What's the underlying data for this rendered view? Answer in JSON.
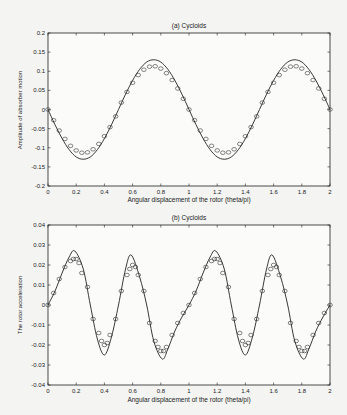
{
  "chart_data": [
    {
      "type": "line",
      "title": "(a) Cycloids",
      "xlabel": "Angular displacement of the rotor (theta/pi)",
      "ylabel": "Amplitude of absorber motion",
      "xlim": [
        0,
        2
      ],
      "ylim": [
        -0.2,
        0.2
      ],
      "xticks": [
        0,
        0.2,
        0.4,
        0.6,
        0.8,
        1,
        1.2,
        1.4,
        1.6,
        1.8,
        2
      ],
      "xticklabels": [
        "0",
        "0.2",
        "0.4",
        "0.6",
        "0.8",
        "1",
        "1.2",
        "1.4",
        "1.6",
        "1.8",
        "2"
      ],
      "yticks": [
        -0.2,
        -0.15,
        -0.1,
        -0.05,
        0,
        0.05,
        0.1,
        0.15,
        0.2
      ],
      "yticklabels": [
        "-0.2",
        "-0.15",
        "-0.1",
        "-0.05",
        "0",
        "0.05",
        "0.1",
        "0.15",
        "0.2"
      ],
      "grid": false,
      "series": [
        {
          "name": "solid line",
          "style": "line",
          "period": 1,
          "x": [
            0,
            0.05,
            0.1,
            0.15,
            0.2,
            0.25,
            0.3,
            0.35,
            0.4,
            0.45,
            0.5,
            0.55,
            0.6,
            0.65,
            0.7,
            0.75,
            0.8,
            0.85,
            0.9,
            0.95,
            1.0
          ],
          "values": [
            0,
            -0.04,
            -0.076,
            -0.105,
            -0.124,
            -0.13,
            -0.124,
            -0.105,
            -0.076,
            -0.04,
            0,
            0.04,
            0.076,
            0.105,
            0.124,
            0.13,
            0.124,
            0.105,
            0.076,
            0.04,
            0
          ]
        },
        {
          "name": "circle markers",
          "style": "markers",
          "period": 1,
          "x": [
            0,
            0.04,
            0.08,
            0.12,
            0.16,
            0.2,
            0.24,
            0.28,
            0.32,
            0.36,
            0.4,
            0.44,
            0.48,
            0.52,
            0.56,
            0.6,
            0.64,
            0.68,
            0.72,
            0.76,
            0.8,
            0.84,
            0.88,
            0.92,
            0.96,
            1.0
          ],
          "values": [
            0,
            -0.028,
            -0.055,
            -0.077,
            -0.095,
            -0.107,
            -0.113,
            -0.112,
            -0.104,
            -0.09,
            -0.07,
            -0.046,
            -0.018,
            0.018,
            0.046,
            0.07,
            0.09,
            0.104,
            0.112,
            0.113,
            0.107,
            0.095,
            0.077,
            0.055,
            0.028,
            0
          ]
        }
      ]
    },
    {
      "type": "line",
      "title": "(b) Cycloids",
      "xlabel": "Angular displacement of the rotor (theta/pi)",
      "ylabel": "The rotor acceleration",
      "xlim": [
        0,
        2
      ],
      "ylim": [
        -0.04,
        0.04
      ],
      "xticks": [
        0,
        0.2,
        0.4,
        0.6,
        0.8,
        1,
        1.2,
        1.4,
        1.6,
        1.8,
        2
      ],
      "xticklabels": [
        "0",
        "0.2",
        "0.4",
        "0.6",
        "0.8",
        "1",
        "1.2",
        "1.4",
        "1.6",
        "1.8",
        "2"
      ],
      "yticks": [
        -0.04,
        -0.03,
        -0.02,
        -0.01,
        0,
        0.01,
        0.02,
        0.03,
        0.04
      ],
      "yticklabels": [
        "-0.04",
        "-0.03",
        "-0.02",
        "-0.01",
        "0",
        "0.01",
        "0.02",
        "0.03",
        "0.04"
      ],
      "grid": false,
      "series": [
        {
          "name": "solid line",
          "style": "line",
          "period": 1,
          "x": [
            0,
            0.05,
            0.1,
            0.15,
            0.19,
            0.25,
            0.3,
            0.35,
            0.4,
            0.45,
            0.5,
            0.55,
            0.59,
            0.65,
            0.7,
            0.75,
            0.81,
            0.85,
            0.9,
            0.95,
            1.0
          ],
          "values": [
            0,
            0.007,
            0.016,
            0.024,
            0.027,
            0.018,
            0.0,
            -0.017,
            -0.025,
            -0.016,
            0.0,
            0.018,
            0.025,
            0.014,
            0.0,
            -0.018,
            -0.027,
            -0.022,
            -0.013,
            -0.006,
            0
          ]
        },
        {
          "name": "circle markers",
          "style": "markers",
          "period": 1,
          "x": [
            0,
            0.04,
            0.08,
            0.12,
            0.16,
            0.18,
            0.2,
            0.22,
            0.24,
            0.28,
            0.32,
            0.36,
            0.38,
            0.4,
            0.42,
            0.44,
            0.48,
            0.52,
            0.56,
            0.58,
            0.6,
            0.62,
            0.64,
            0.68,
            0.72,
            0.76,
            0.78,
            0.8,
            0.82,
            0.84,
            0.88,
            0.92,
            0.96,
            1.0
          ],
          "values": [
            0,
            0.006,
            0.013,
            0.019,
            0.022,
            0.023,
            0.023,
            0.021,
            0.016,
            0.009,
            -0.007,
            -0.014,
            -0.018,
            -0.02,
            -0.019,
            -0.015,
            -0.007,
            0.007,
            0.015,
            0.018,
            0.02,
            0.019,
            0.015,
            0.007,
            -0.009,
            -0.018,
            -0.021,
            -0.023,
            -0.023,
            -0.021,
            -0.015,
            -0.009,
            -0.004,
            0
          ]
        }
      ]
    }
  ],
  "panels": {
    "a": {
      "title": "(a) Cycloids",
      "xlabel": "Angular displacement of the rotor (theta/pi)",
      "ylabel": "Amplitude of absorber motion"
    },
    "b": {
      "title": "(b) Cycloids",
      "xlabel": "Angular displacement of the rotor (theta/pi)",
      "ylabel": "The rotor acceleration"
    }
  }
}
